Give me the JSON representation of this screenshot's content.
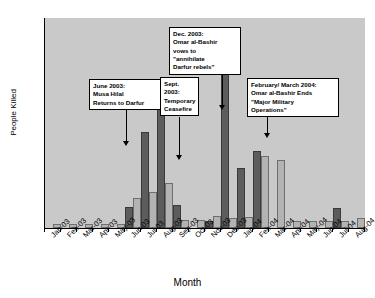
{
  "chart_data": {
    "type": "bar",
    "title": "",
    "xlabel": "Month",
    "ylabel": "People Killed",
    "ylim": [
      0,
      3500
    ],
    "ytick_step": 500,
    "yticks": [
      0,
      500,
      1000,
      1500,
      2000,
      2500,
      3000,
      3500
    ],
    "grid": false,
    "legend": "none",
    "plot_background": "#c9c9c9",
    "categories": [
      "Jan-03",
      "Feb-03",
      "Mar-03",
      "Apr-03",
      "May-03",
      "Jun-03",
      "Jul-03",
      "Aug-03",
      "Sep-03",
      "Oct-03",
      "Nov-03",
      "Dec-03",
      "Jan-04",
      "Feb-04",
      "Mar-04",
      "Apr-04",
      "May-04",
      "Jun-04",
      "Jul-04",
      "Aug-04"
    ],
    "series": [
      {
        "name": "Series 1",
        "color": "#5c5c5c",
        "values": [
          0,
          0,
          0,
          0,
          0,
          350,
          1600,
          2270,
          380,
          0,
          120,
          3250,
          1000,
          1290,
          0,
          0,
          0,
          0,
          330,
          0
        ]
      },
      {
        "name": "Series 2",
        "color": "#b3b3b3",
        "values": [
          60,
          70,
          70,
          70,
          70,
          500,
          600,
          750,
          130,
          140,
          200,
          160,
          190,
          1200,
          1140,
          110,
          110,
          110,
          110,
          170
        ]
      }
    ],
    "annotations": [
      {
        "id": "musa-hilal",
        "lines": [
          "June 2003:",
          "Musa Hilal",
          "Returns to Darfur"
        ],
        "points_to": "Jun-03"
      },
      {
        "id": "ceasefire",
        "lines": [
          "Sept.",
          "2003:",
          "Temporary",
          "Ceasefire"
        ],
        "points_to": "Sep-03"
      },
      {
        "id": "annihilate",
        "lines": [
          "Dec. 2003:",
          "Omar al-Bashir",
          "vows to",
          "\"annihilate",
          "Darfur rebels\""
        ],
        "points_to": "Dec-03"
      },
      {
        "id": "major-military-operations",
        "lines": [
          "February/ March 2004:",
          "Omar al-Bashir Ends",
          "\"Major Military",
          "Operations\""
        ],
        "points_to": "Feb-04"
      }
    ]
  }
}
